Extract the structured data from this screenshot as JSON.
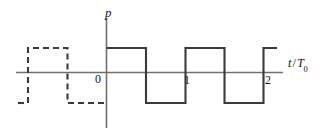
{
  "figure": {
    "kind": "square-wave-timing-diagram",
    "background_color": "#ffffff",
    "axis_color": "#6f6f6f",
    "wave_color": "#3a3a3a",
    "label_color": "#1a1a1a",
    "axes": {
      "vertical_label": "p",
      "horizontal_label_var": "t",
      "horizontal_label_slash": "/",
      "horizontal_label_unit": "T",
      "horizontal_label_unit_sub": "0",
      "horizontal_label_full": "t / T0",
      "origin_label": "0",
      "x_ticks": [
        "0",
        "1",
        "2"
      ]
    },
    "geometry": {
      "x_axis_y": 72.5,
      "y_axis_x": 106.5,
      "high_level_y": 48,
      "low_level_y": 103,
      "x_axis_start": 16,
      "x_axis_end": 283,
      "y_axis_top": 18,
      "y_axis_bottom": 128,
      "period_px": 79,
      "tick_x_0": 106.5,
      "tick_x_1": 185.5,
      "tick_x_2": 263.5
    },
    "solid_wave": {
      "style": "solid",
      "description": "Two-and-a-bit periods of a bipolar square wave starting high at t=0",
      "points": [
        [
          106.5,
          48
        ],
        [
          146,
          48
        ],
        [
          146,
          103
        ],
        [
          185.5,
          103
        ],
        [
          185.5,
          48
        ],
        [
          224.5,
          48
        ],
        [
          224.5,
          103
        ],
        [
          263.5,
          103
        ],
        [
          263.5,
          48
        ],
        [
          277,
          48
        ]
      ]
    },
    "dashed_wave": {
      "style": "dashed",
      "description": "Extrapolated earlier period of the same square wave for negative time",
      "points": [
        [
          18,
          103
        ],
        [
          24,
          103
        ],
        [
          28,
          103
        ],
        [
          28,
          48
        ],
        [
          67.5,
          48
        ],
        [
          67.5,
          103
        ],
        [
          106.5,
          103
        ]
      ],
      "dash_pattern": "6 4"
    }
  }
}
